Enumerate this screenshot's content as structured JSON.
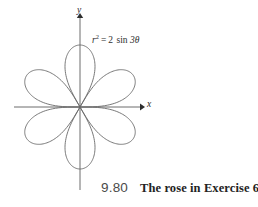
{
  "figure": {
    "equation": {
      "lhs_var": "r",
      "lhs_exp": "2",
      "equals": "=",
      "coefficient": "2",
      "function": "sin",
      "argument": "3θ",
      "full_text": "r² = 2 sin 3θ"
    },
    "axes": {
      "x_label": "x",
      "y_label": "y",
      "origin_x": 80,
      "origin_y": 107,
      "x_min": 14,
      "x_max": 144,
      "y_min": 14,
      "y_max": 190,
      "axis_color": "#5c5c5c"
    },
    "curve": {
      "color": "#6a6a6a",
      "stroke_width": 0.9
    }
  },
  "caption": {
    "number": "9.80",
    "text": "The rose in Exercise 6."
  },
  "chart_data": {
    "type": "line",
    "title": "",
    "subtitle": "",
    "xlabel": "x",
    "ylabel": "y",
    "annotations": [
      "r² = 2 sin 3θ"
    ],
    "grid": false,
    "legend": null,
    "polar": true,
    "equation": "r^2 = 2 sin(3*theta)",
    "petal_count": 6,
    "max_radius": 1.4142,
    "petal_angles_deg": [
      30,
      90,
      150,
      210,
      270,
      330
    ],
    "xlim": [
      -1.5,
      1.5
    ],
    "ylim": [
      -1.5,
      1.5
    ],
    "series": [
      {
        "name": "r² = 2 sin 3θ",
        "petals": [
          {
            "tip_angle_deg": 30,
            "tip_r": 1.4142
          },
          {
            "tip_angle_deg": 90,
            "tip_r": 1.4142
          },
          {
            "tip_angle_deg": 150,
            "tip_r": 1.4142
          },
          {
            "tip_angle_deg": 210,
            "tip_r": 1.4142
          },
          {
            "tip_angle_deg": 270,
            "tip_r": 1.4142
          },
          {
            "tip_angle_deg": 330,
            "tip_r": 1.4142
          }
        ]
      }
    ]
  }
}
